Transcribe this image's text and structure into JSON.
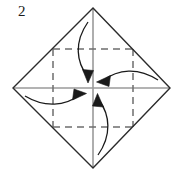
{
  "figure": {
    "step_label": "2",
    "width": 185,
    "height": 173,
    "background_color": "#ffffff"
  },
  "colors": {
    "outline": "#2b2b2b",
    "crease_dashed": "#6e6e6e",
    "axis_gray": "#9a9a9a",
    "arrow": "#1a1a1a",
    "background": "#ffffff"
  },
  "geometry": {
    "center": {
      "x": 93,
      "y": 88
    },
    "diamond_vertices": [
      {
        "name": "top",
        "x": 93,
        "y": 8
      },
      {
        "name": "right",
        "x": 170,
        "y": 88
      },
      {
        "name": "bottom",
        "x": 93,
        "y": 168
      },
      {
        "name": "left",
        "x": 13,
        "y": 88
      }
    ],
    "dashed_square": {
      "left": 53,
      "top": 49,
      "right": 133,
      "bottom": 127
    },
    "axis_horizontal": {
      "x1": 13,
      "y1": 88,
      "x2": 170,
      "y2": 88
    },
    "axis_vertical": {
      "x1": 93,
      "y1": 8,
      "x2": 93,
      "y2": 168
    }
  },
  "arrows": [
    {
      "name": "fold-top-to-center",
      "label": "top corner folds down to center",
      "direction": "down",
      "path": "M 88 22 C 74 42, 76 62, 88 77",
      "head": "M 88 83 L 83 70 L 93 71 Z"
    },
    {
      "name": "fold-right-to-center",
      "label": "right corner folds left to center",
      "direction": "left",
      "path": "M 158 80 C 138 68, 118 70, 103 81",
      "head": "M 97 82 L 110 76 L 109 86 Z"
    },
    {
      "name": "fold-bottom-to-center",
      "label": "bottom corner folds up to center",
      "direction": "up",
      "path": "M 98 155 C 112 135, 110 115, 99 100",
      "head": "M 98 94 L 103 107 L 93 106 Z"
    },
    {
      "name": "fold-left-to-center",
      "label": "left corner folds right to center",
      "direction": "right",
      "path": "M 25 96 C 45 108, 65 106, 80 95",
      "head": "M 86 94 L 73 100 L 74 90 Z"
    }
  ]
}
